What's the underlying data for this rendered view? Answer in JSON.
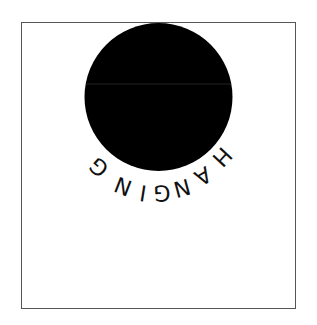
{
  "illustration": {
    "caption_text": "HANGING",
    "letters": [
      "H",
      "A",
      "N",
      "G",
      "I",
      "N",
      "G"
    ],
    "circle_color": "#000000",
    "border_color": "#555555",
    "background_color": "#ffffff"
  }
}
